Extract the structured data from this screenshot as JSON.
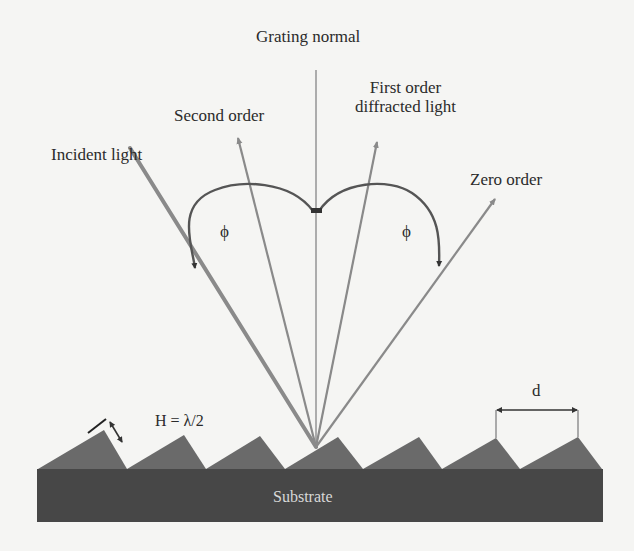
{
  "labels": {
    "grating_normal": "Grating normal",
    "second_order": "Second order",
    "first_order_line1": "First order",
    "first_order_line2": "diffracted light",
    "incident_light": "Incident light",
    "zero_order": "Zero order",
    "phi_left": "ϕ",
    "phi_right": "ϕ",
    "blaze_height": "H = λ/2",
    "period": "d",
    "substrate": "Substrate"
  },
  "colors": {
    "background": "#f5f5f3",
    "rays": "#8a8a8a",
    "incident_ray": "#7a7a7a",
    "arc": "#555555",
    "teeth": "#6a6a6a",
    "substrate": "#474747",
    "text": "#2b2b2b"
  }
}
